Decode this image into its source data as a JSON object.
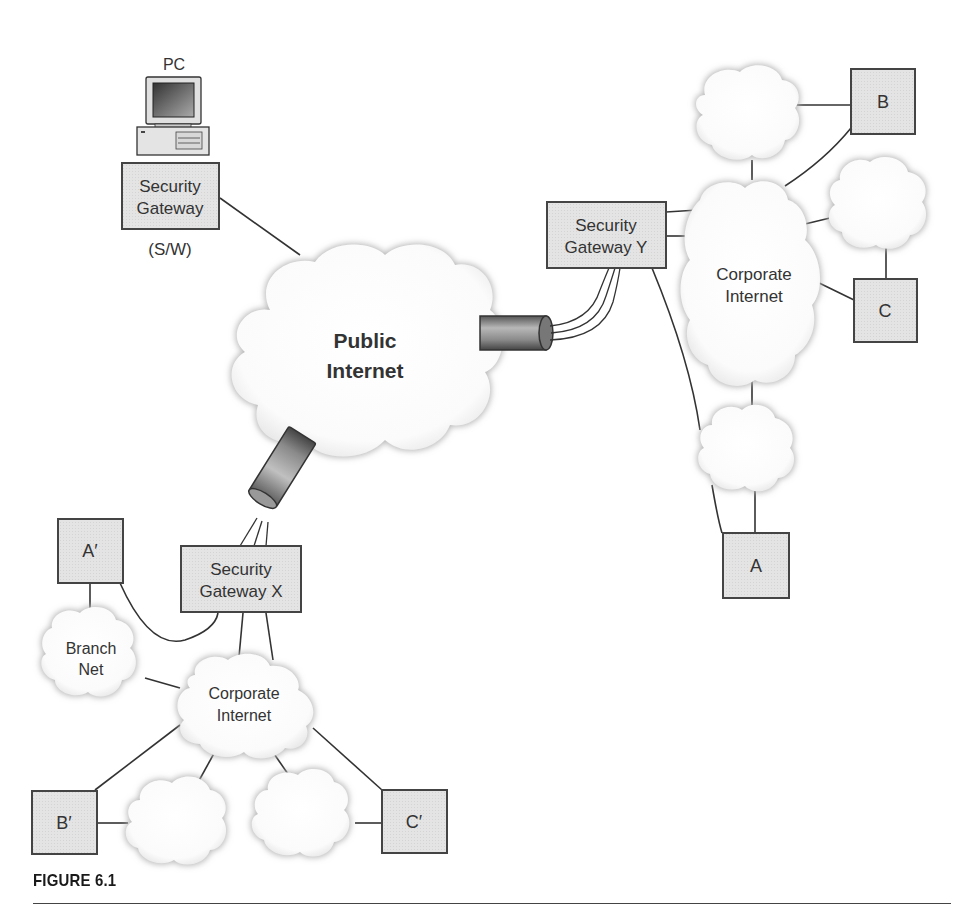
{
  "figure": {
    "caption": "FIGURE 6.1"
  },
  "pc": {
    "label": "PC",
    "gateway_line1": "Security",
    "gateway_line2": "Gateway",
    "gateway_note": "(S/W)"
  },
  "public_internet": {
    "line1": "Public",
    "line2": "Internet"
  },
  "gateway_y": {
    "line1": "Security",
    "line2": "Gateway Y"
  },
  "gateway_x": {
    "line1": "Security",
    "line2": "Gateway X"
  },
  "corporate_right": {
    "line1": "Corporate",
    "line2": "Internet"
  },
  "corporate_left": {
    "line1": "Corporate",
    "line2": "Internet"
  },
  "branch_net": {
    "line1": "Branch",
    "line2": "Net"
  },
  "nodes": {
    "a": "A",
    "b": "B",
    "c": "C",
    "a_prime": "A′",
    "b_prime": "B′",
    "c_prime": "C′"
  },
  "colors": {
    "box_fill": "#e2e2e2",
    "box_stroke": "#444444",
    "line": "#333333",
    "cloud_fill": "#ffffff",
    "cloud_edge": "#c8c8c8"
  }
}
